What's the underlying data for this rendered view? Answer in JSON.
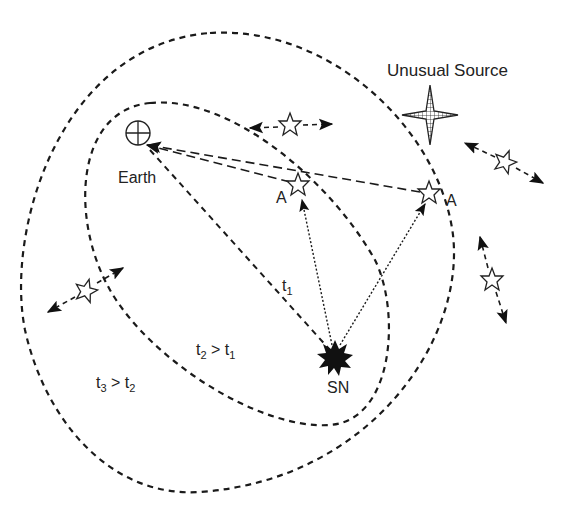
{
  "diagram": {
    "type": "light-echo geometry",
    "labels": {
      "unusual_source": "Unusual Source",
      "earth": "Earth",
      "star_a_inner": "A",
      "star_a_outer": "A",
      "supernova": "SN",
      "t1": "t",
      "t1_sub": "1",
      "t2_base": "t",
      "t2_sub": "2",
      "t2_cmp": " > t",
      "t2_cmp_sub": "1",
      "t3_base": "t",
      "t3_sub": "3",
      "t3_cmp": " > t",
      "t3_cmp_sub": "2"
    },
    "nodes": [
      {
        "id": "earth",
        "symbol": "circle-plus",
        "x": 138,
        "y": 133
      },
      {
        "id": "star-a1",
        "symbol": "open-star",
        "x": 298,
        "y": 185
      },
      {
        "id": "star-a2",
        "symbol": "open-star",
        "x": 429,
        "y": 193
      },
      {
        "id": "sn",
        "symbol": "burst",
        "x": 335,
        "y": 357
      },
      {
        "id": "unusual-source",
        "symbol": "four-point-star-hatched",
        "x": 430,
        "y": 115
      },
      {
        "id": "star-top",
        "symbol": "open-star",
        "x": 290,
        "y": 125
      },
      {
        "id": "star-right-upper",
        "symbol": "open-star",
        "x": 505,
        "y": 162
      },
      {
        "id": "star-right-lower",
        "symbol": "open-star",
        "x": 492,
        "y": 280
      },
      {
        "id": "star-left",
        "symbol": "open-star",
        "x": 85,
        "y": 291
      }
    ],
    "ellipses": [
      {
        "id": "inner-ellipse",
        "label": "t2 > t1"
      },
      {
        "id": "outer-ellipse",
        "label": "t3 > t2"
      }
    ],
    "colors": {
      "ink": "#1a1a1a",
      "background": "#ffffff"
    }
  }
}
